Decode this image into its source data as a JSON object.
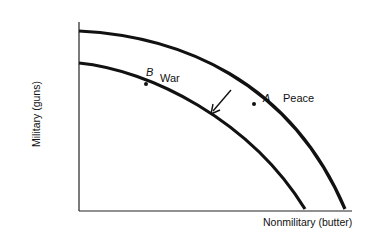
{
  "diagram": {
    "type": "production-possibilities-frontier",
    "y_axis_label": "Military (guns)",
    "x_axis_label": "Nonmilitary (butter)",
    "curves": [
      {
        "name": "peace-frontier",
        "point_label": "A",
        "curve_label": "Peace"
      },
      {
        "name": "war-frontier",
        "point_label": "B",
        "curve_label": "War"
      }
    ],
    "arrow": "inward shift from peace frontier to war frontier",
    "colors": {
      "ink": "#111111",
      "background": "#ffffff"
    }
  }
}
